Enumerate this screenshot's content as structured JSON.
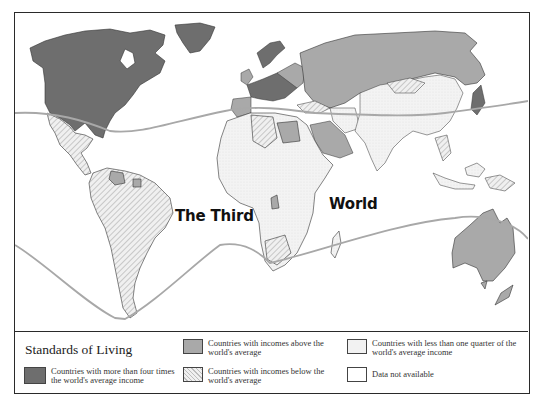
{
  "map": {
    "title_left": "The Third",
    "title_right": "World",
    "divider_line_color": "#a8a8a8"
  },
  "legend": {
    "title": "Standards of Living",
    "items": [
      {
        "label": "Countries with more than four times the world's average income",
        "fill": "#6e6e6e",
        "pattern": "solid"
      },
      {
        "label": "Countries with incomes above the world's average",
        "fill": "#a9a9a9",
        "pattern": "solid"
      },
      {
        "label": "Countries with incomes below the world's average",
        "fill": "#ececec",
        "pattern": "hatched"
      },
      {
        "label": "Countries with less than one quarter of the world's average income",
        "fill": "#f2f2f2",
        "pattern": "dotted"
      },
      {
        "label": "Data not available",
        "fill": "#ffffff",
        "pattern": "none"
      }
    ]
  }
}
